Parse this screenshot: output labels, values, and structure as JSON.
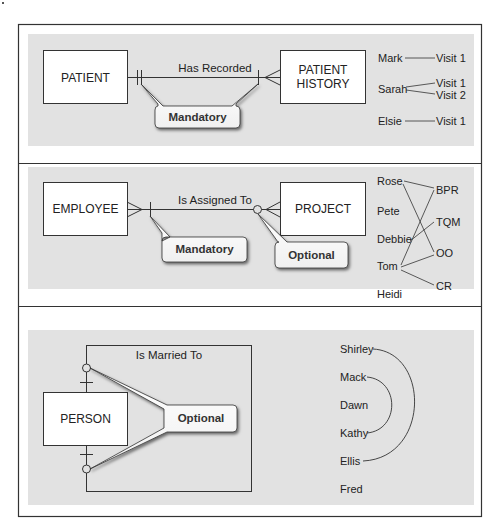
{
  "sections": [
    {
      "id": "one-to-many-mandatory",
      "entity_left": "PATIENT",
      "entity_right": [
        "PATIENT",
        "HISTORY"
      ],
      "relationship": "Has Recorded",
      "callouts": [
        {
          "label": "Mandatory"
        }
      ],
      "instances": {
        "left": [
          "Mark",
          "Sarah",
          "Elsie"
        ],
        "right_rows": [
          [
            "Visit 1"
          ],
          [
            "Visit 1",
            "Visit 2"
          ],
          [
            "Visit 1"
          ]
        ],
        "links": [
          {
            "from": "Mark",
            "to": "Visit 1"
          },
          {
            "from": "Sarah",
            "to": "Visit 1"
          },
          {
            "from": "Sarah",
            "to": "Visit 2"
          },
          {
            "from": "Elsie",
            "to": "Visit 1"
          }
        ]
      }
    },
    {
      "id": "many-to-many-optional",
      "entity_left": "EMPLOYEE",
      "entity_right": "PROJECT",
      "relationship": "Is Assigned To",
      "callouts": [
        {
          "label": "Mandatory"
        },
        {
          "label": "Optional"
        }
      ],
      "instances": {
        "left": [
          "Rose",
          "Pete",
          "Debbie",
          "Tom",
          "Heidi"
        ],
        "right": [
          "BPR",
          "TQM",
          "OO",
          "CR"
        ],
        "links": [
          {
            "from": "Rose",
            "to": "BPR"
          },
          {
            "from": "Rose",
            "to": "OO"
          },
          {
            "from": "Debbie",
            "to": "TQM"
          },
          {
            "from": "Tom",
            "to": "BPR"
          },
          {
            "from": "Tom",
            "to": "OO"
          },
          {
            "from": "Tom",
            "to": "CR"
          }
        ]
      }
    },
    {
      "id": "unary-one-to-one-optional",
      "entity": "PERSON",
      "relationship": "Is Married To",
      "callouts": [
        {
          "label": "Optional"
        }
      ],
      "instances": {
        "people": [
          "Shirley",
          "Mack",
          "Dawn",
          "Kathy",
          "Ellis",
          "Fred"
        ],
        "links": [
          {
            "from": "Shirley",
            "to": "Ellis"
          },
          {
            "from": "Mack",
            "to": "Kathy"
          }
        ]
      }
    }
  ],
  "colors": {
    "panel_bg": "#e2e2e2",
    "line": "#333333",
    "box_fill": "#ffffff",
    "frame": "#333333"
  }
}
